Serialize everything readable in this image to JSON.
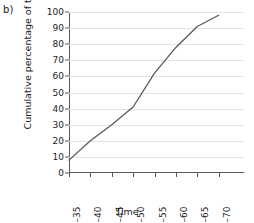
{
  "panel": {
    "label": "b)"
  },
  "chart_data": {
    "type": "line",
    "title": "",
    "subtitle": "",
    "xlabel": "Time",
    "ylabel": "Cumulative percentage of time",
    "categories": [
      "30–35",
      "35–40",
      "40–45",
      "45–50",
      "50–55",
      "55–60",
      "60–65",
      "65–70"
    ],
    "values": [
      8,
      20,
      30,
      41,
      62,
      78,
      91,
      98
    ],
    "series": [
      {
        "name": "Cumulative percentage of time",
        "values": [
          8,
          20,
          30,
          41,
          62,
          78,
          91,
          98
        ]
      }
    ],
    "ylim": [
      0,
      100
    ],
    "yticks": [
      0,
      10,
      20,
      30,
      40,
      50,
      60,
      70,
      80,
      90,
      100
    ],
    "ytick_labels": [
      "0",
      "10",
      "20",
      "30",
      "40",
      "50",
      "60",
      "70",
      "80",
      "90",
      "100"
    ],
    "grid": true,
    "grid_axis": "y",
    "legend": false,
    "legend_position": "none",
    "line_color": "#5a5a5a",
    "grid_color": "#e3e3e3",
    "axis_color": "#5a5a5a",
    "markers": false,
    "x_tick_label_rotation": -90
  }
}
